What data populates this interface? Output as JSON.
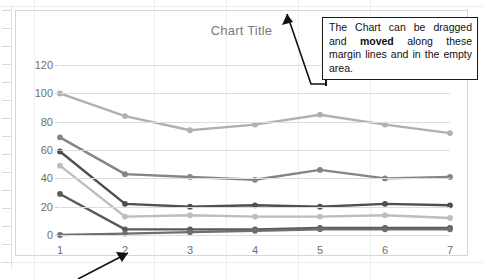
{
  "document": {
    "background_color": "#ffffff",
    "ruler_tick_color": "#d9d9d9"
  },
  "chart": {
    "title": "Chart Title",
    "title_color": "#7b7b7b",
    "frame_color": "#d6d6d6",
    "gridline_color": "#dddddd"
  },
  "callout": {
    "text_part_1": "The Chart can be dragged and ",
    "text_bold": "moved",
    "text_part_2": " along these margin lines and in the empty area.",
    "border_color": "#1a1a1a",
    "background_color": "#ffffff"
  },
  "annotations": {
    "arrow_to_title_label": "arrow-to-chart-top",
    "arrow_to_axis_label": "arrow-to-category-axis"
  },
  "chart_data": {
    "type": "line",
    "title": "Chart Title",
    "xlabel": "",
    "ylabel": "",
    "categories": [
      "1",
      "2",
      "3",
      "4",
      "5",
      "6",
      "7"
    ],
    "x_tick_labels": [
      "1",
      "2",
      "3",
      "4",
      "5",
      "6",
      "7"
    ],
    "y_tick_labels": [
      "0",
      "20",
      "40",
      "60",
      "80",
      "100",
      "120"
    ],
    "y_ticks": [
      0,
      20,
      40,
      60,
      80,
      100,
      120
    ],
    "ylim": [
      0,
      130
    ],
    "grid": true,
    "legend": "none",
    "markers": true,
    "series": [
      {
        "name": "Series 1",
        "color": "#b0b0b0",
        "values": [
          100,
          84,
          74,
          78,
          85,
          78,
          72
        ]
      },
      {
        "name": "Series 2",
        "color": "#858585",
        "values": [
          69,
          43,
          41,
          39,
          46,
          40,
          41
        ]
      },
      {
        "name": "Series 3",
        "color": "#4f4f4f",
        "values": [
          59,
          22,
          20,
          21,
          20,
          22,
          21
        ]
      },
      {
        "name": "Series 4",
        "color": "#bdbdbd",
        "values": [
          49,
          13,
          14,
          13,
          13,
          14,
          12
        ]
      },
      {
        "name": "Series 5",
        "color": "#5a5a5a",
        "values": [
          29,
          4,
          4,
          4,
          5,
          5,
          5
        ]
      },
      {
        "name": "Series 6",
        "color": "#6e6e6e",
        "values": [
          0,
          1,
          2,
          3,
          4,
          4,
          4
        ]
      }
    ]
  }
}
